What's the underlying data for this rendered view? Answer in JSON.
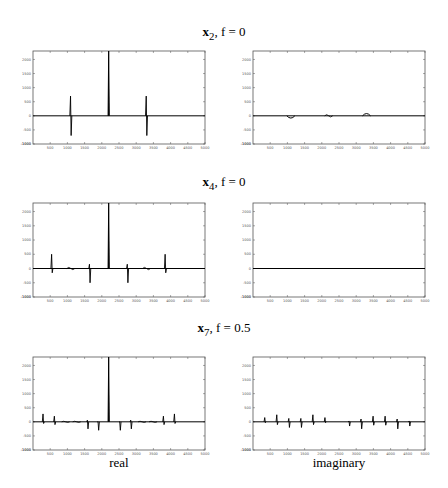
{
  "rows": [
    {
      "title_var": "x",
      "title_sub": "2",
      "title_rest": ", f = 0",
      "title_text": "x2, f = 0"
    },
    {
      "title_var": "x",
      "title_sub": "4",
      "title_rest": ", f = 0",
      "title_text": "x4, f = 0"
    },
    {
      "title_var": "x",
      "title_sub": "7",
      "title_rest": ", f = 0.5",
      "title_text": "x7, f = 0.5"
    }
  ],
  "columns": {
    "left_label": "real",
    "right_label": "imaginary"
  },
  "axes": {
    "xlim": [
      0,
      5000
    ],
    "ylim": [
      -1000,
      2300
    ],
    "xticks": [
      500,
      1000,
      1500,
      2000,
      2500,
      3000,
      3500,
      4000,
      4500,
      5000
    ],
    "yticks": [
      -1000,
      -500,
      0,
      500,
      1000,
      1500,
      2000
    ]
  },
  "chart_data": [
    {
      "type": "line",
      "title": "x2, f = 0 (real)",
      "xlabel": "",
      "ylabel": "",
      "xlim": [
        0,
        5000
      ],
      "ylim": [
        -1000,
        2300
      ],
      "features": [
        {
          "x": 1100,
          "kind": "bipolar",
          "up": 700,
          "down": -700
        },
        {
          "x": 2200,
          "kind": "spike",
          "up": 2300,
          "down": 0
        },
        {
          "x": 3300,
          "kind": "bipolar",
          "up": 700,
          "down": -700
        }
      ]
    },
    {
      "type": "line",
      "title": "x2, f = 0 (imaginary)",
      "xlim": [
        0,
        5000
      ],
      "ylim": [
        -1000,
        2300
      ],
      "features": [
        {
          "x": 1100,
          "kind": "bump",
          "up": 0,
          "down": -80
        },
        {
          "x": 2200,
          "kind": "wiggle",
          "up": 40,
          "down": -40
        },
        {
          "x": 3300,
          "kind": "bump",
          "up": 80,
          "down": 0
        }
      ]
    },
    {
      "type": "line",
      "title": "x4, f = 0 (real)",
      "xlim": [
        0,
        5000
      ],
      "ylim": [
        -1000,
        2300
      ],
      "features": [
        {
          "x": 550,
          "kind": "bipolar",
          "up": 500,
          "down": -150
        },
        {
          "x": 1100,
          "kind": "wiggle",
          "up": 40,
          "down": -40
        },
        {
          "x": 1650,
          "kind": "bipolar",
          "up": 150,
          "down": -500
        },
        {
          "x": 2200,
          "kind": "spike",
          "up": 2300,
          "down": 0
        },
        {
          "x": 2750,
          "kind": "bipolar",
          "up": 150,
          "down": -500
        },
        {
          "x": 3300,
          "kind": "wiggle",
          "up": 40,
          "down": -40
        },
        {
          "x": 3850,
          "kind": "bipolar",
          "up": 500,
          "down": -150
        }
      ]
    },
    {
      "type": "line",
      "title": "x4, f = 0 (imaginary)",
      "xlim": [
        0,
        5000
      ],
      "ylim": [
        -1000,
        2300
      ],
      "features": [
        {
          "x": 2500,
          "kind": "flat",
          "up": 10,
          "down": -10
        }
      ]
    },
    {
      "type": "line",
      "title": "x7, f = 0.5 (real)",
      "xlim": [
        0,
        5000
      ],
      "ylim": [
        -1000,
        2300
      ],
      "features": [
        {
          "x": 300,
          "kind": "bipolar",
          "up": 280,
          "down": -60
        },
        {
          "x": 630,
          "kind": "bipolar",
          "up": 200,
          "down": -100
        },
        {
          "x": 950,
          "kind": "wiggle",
          "up": 20,
          "down": -20
        },
        {
          "x": 1270,
          "kind": "wiggle",
          "up": 20,
          "down": -20
        },
        {
          "x": 1590,
          "kind": "bipolar",
          "up": 60,
          "down": -250
        },
        {
          "x": 1900,
          "kind": "bipolar",
          "up": 0,
          "down": -300
        },
        {
          "x": 2200,
          "kind": "spike",
          "up": 2300,
          "down": 0
        },
        {
          "x": 2530,
          "kind": "bipolar",
          "up": 0,
          "down": -300
        },
        {
          "x": 2850,
          "kind": "bipolar",
          "up": 60,
          "down": -250
        },
        {
          "x": 3170,
          "kind": "wiggle",
          "up": 20,
          "down": -20
        },
        {
          "x": 3490,
          "kind": "wiggle",
          "up": 20,
          "down": -20
        },
        {
          "x": 3800,
          "kind": "bipolar",
          "up": 200,
          "down": -100
        },
        {
          "x": 4120,
          "kind": "bipolar",
          "up": 280,
          "down": -60
        }
      ]
    },
    {
      "type": "line",
      "title": "x7, f = 0.5 (imaginary)",
      "xlim": [
        0,
        5000
      ],
      "ylim": [
        -1000,
        2300
      ],
      "features": [
        {
          "x": 350,
          "kind": "bipolar",
          "up": 150,
          "down": -30
        },
        {
          "x": 700,
          "kind": "bipolar",
          "up": 250,
          "down": -100
        },
        {
          "x": 1050,
          "kind": "bipolar",
          "up": 120,
          "down": -200
        },
        {
          "x": 1400,
          "kind": "bipolar",
          "up": 120,
          "down": -200
        },
        {
          "x": 1750,
          "kind": "bipolar",
          "up": 250,
          "down": -100
        },
        {
          "x": 2100,
          "kind": "bipolar",
          "up": 150,
          "down": -30
        },
        {
          "x": 2800,
          "kind": "bipolar",
          "up": 30,
          "down": -150
        },
        {
          "x": 3150,
          "kind": "bipolar",
          "up": 100,
          "down": -250
        },
        {
          "x": 3500,
          "kind": "bipolar",
          "up": 200,
          "down": -120
        },
        {
          "x": 3850,
          "kind": "bipolar",
          "up": 200,
          "down": -120
        },
        {
          "x": 4200,
          "kind": "bipolar",
          "up": 100,
          "down": -250
        },
        {
          "x": 4550,
          "kind": "bipolar",
          "up": 30,
          "down": -150
        }
      ]
    }
  ]
}
